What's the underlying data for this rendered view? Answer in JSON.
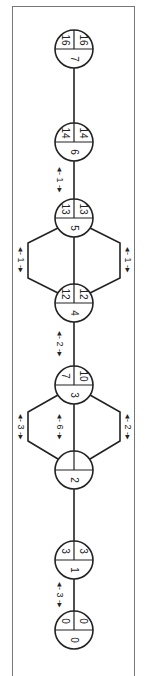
{
  "diagram": {
    "type": "activity-on-node network (rotated 90°)",
    "nodes": [
      {
        "id": "0",
        "es": "0",
        "ls": "0",
        "cy": 630
      },
      {
        "id": "1",
        "es": "3",
        "ls": "3",
        "cy": 560
      },
      {
        "id": "2",
        "es": "",
        "ls": "",
        "cy": 470
      },
      {
        "id": "3",
        "es": "7",
        "ls": "10",
        "cy": 385
      },
      {
        "id": "4",
        "es": "12",
        "ls": "12",
        "cy": 303
      },
      {
        "id": "5",
        "es": "13",
        "ls": "13",
        "cy": 218
      },
      {
        "id": "6",
        "es": "14",
        "ls": "14",
        "cy": 142
      },
      {
        "id": "7",
        "es": "16",
        "ls": "16",
        "cy": 49
      }
    ],
    "durations": [
      {
        "label": "3",
        "between": "0-1",
        "position": "center"
      },
      {
        "label": "3",
        "between": "2-3",
        "position": "left-branch"
      },
      {
        "label": "6",
        "between": "2-3",
        "position": "center"
      },
      {
        "label": "2",
        "between": "2-3",
        "position": "right-branch"
      },
      {
        "label": "2",
        "between": "3-4",
        "position": "center"
      },
      {
        "label": "1",
        "between": "4-5",
        "position": "left-branch"
      },
      {
        "label": "1",
        "between": "4-5",
        "position": "right-branch"
      },
      {
        "label": "1",
        "between": "5-6",
        "position": "center"
      }
    ],
    "colors": {
      "stroke": "#222222",
      "frame": "#777777",
      "background": "#ffffff"
    }
  }
}
